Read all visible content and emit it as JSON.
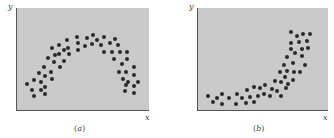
{
  "chart_data": [
    {
      "type": "scatter",
      "panel_label": "(a)",
      "title": "",
      "xlabel": "x",
      "ylabel": "y",
      "grid": false,
      "ticks": false,
      "pattern": "inverted U-shaped (concave) nonlinear relationship",
      "frame_px": {
        "left": 16,
        "top": 8,
        "right": 148,
        "bottom": 110
      },
      "points_px": [
        [
          26,
          84
        ],
        [
          31,
          90
        ],
        [
          33,
          96
        ],
        [
          33,
          80
        ],
        [
          38,
          73
        ],
        [
          40,
          82
        ],
        [
          40,
          90
        ],
        [
          43,
          67
        ],
        [
          44,
          76
        ],
        [
          44,
          87
        ],
        [
          44,
          94
        ],
        [
          47,
          58
        ],
        [
          51,
          48
        ],
        [
          50,
          72
        ],
        [
          51,
          79
        ],
        [
          53,
          62
        ],
        [
          54,
          55
        ],
        [
          58,
          45
        ],
        [
          58,
          54
        ],
        [
          59,
          67
        ],
        [
          63,
          61
        ],
        [
          63,
          50
        ],
        [
          66,
          40
        ],
        [
          67,
          48
        ],
        [
          68,
          54
        ],
        [
          76,
          37
        ],
        [
          77,
          43
        ],
        [
          77,
          50
        ],
        [
          84,
          46
        ],
        [
          86,
          38
        ],
        [
          91,
          44
        ],
        [
          92,
          35
        ],
        [
          96,
          40
        ],
        [
          100,
          45
        ],
        [
          103,
          37
        ],
        [
          103,
          52
        ],
        [
          109,
          43
        ],
        [
          111,
          52
        ],
        [
          114,
          39
        ],
        [
          113,
          59
        ],
        [
          117,
          45
        ],
        [
          119,
          52
        ],
        [
          121,
          64
        ],
        [
          126,
          52
        ],
        [
          126,
          59
        ],
        [
          118,
          72
        ],
        [
          125,
          72
        ],
        [
          122,
          79
        ],
        [
          127,
          82
        ],
        [
          133,
          67
        ],
        [
          133,
          75
        ],
        [
          137,
          82
        ],
        [
          125,
          85
        ],
        [
          124,
          91
        ],
        [
          133,
          86
        ],
        [
          133,
          93
        ]
      ]
    },
    {
      "type": "scatter",
      "panel_label": "(b)",
      "title": "",
      "xlabel": "x",
      "ylabel": "y",
      "grid": false,
      "ticks": false,
      "pattern": "convex / exponential-like increasing nonlinear relationship",
      "frame_px": {
        "left": 197,
        "top": 8,
        "right": 327,
        "bottom": 110
      },
      "points_px": [
        [
          207,
          96
        ],
        [
          212,
          102
        ],
        [
          216,
          98
        ],
        [
          221,
          94
        ],
        [
          221,
          104
        ],
        [
          228,
          98
        ],
        [
          235,
          104
        ],
        [
          236,
          94
        ],
        [
          241,
          98
        ],
        [
          245,
          103
        ],
        [
          246,
          90
        ],
        [
          249,
          97
        ],
        [
          253,
          87
        ],
        [
          253,
          102
        ],
        [
          257,
          96
        ],
        [
          259,
          88
        ],
        [
          263,
          94
        ],
        [
          264,
          85
        ],
        [
          269,
          96
        ],
        [
          271,
          89
        ],
        [
          274,
          81
        ],
        [
          276,
          91
        ],
        [
          280,
          82
        ],
        [
          280,
          96
        ],
        [
          279,
          72
        ],
        [
          283,
          65
        ],
        [
          284,
          77
        ],
        [
          285,
          88
        ],
        [
          286,
          71
        ],
        [
          286,
          57
        ],
        [
          287,
          84
        ],
        [
          290,
          49
        ],
        [
          290,
          43
        ],
        [
          290,
          32
        ],
        [
          292,
          63
        ],
        [
          293,
          72
        ],
        [
          292,
          80
        ],
        [
          294,
          53
        ],
        [
          296,
          36
        ],
        [
          298,
          42
        ],
        [
          299,
          72
        ],
        [
          301,
          49
        ],
        [
          301,
          56
        ],
        [
          302,
          34
        ],
        [
          304,
          65
        ],
        [
          306,
          41
        ],
        [
          307,
          48
        ],
        [
          309,
          34
        ]
      ]
    }
  ],
  "panels": [
    {
      "ylabel": "y",
      "xlabel": "x",
      "caption_open": "(",
      "caption_letter": "a",
      "caption_close": ")"
    },
    {
      "ylabel": "y",
      "xlabel": "x",
      "caption_open": "(",
      "caption_letter": "b",
      "caption_close": ")"
    }
  ],
  "colors": {
    "plot_bg": "#c9c9c9",
    "dot": "#2a2a2a",
    "axis": "#555555"
  }
}
